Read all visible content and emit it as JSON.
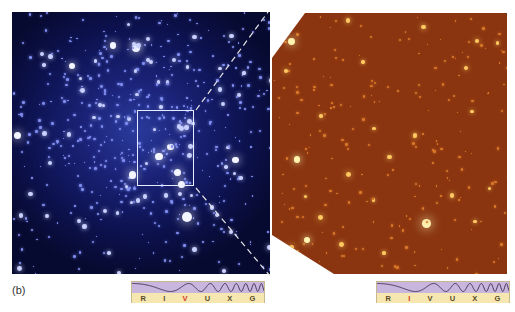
{
  "figure": {
    "panel_label": "(b)",
    "left_image": {
      "description": "star-cluster-visible-light",
      "color": "#1a2276",
      "zoom_box": {
        "left": 137,
        "top": 110,
        "width": 57,
        "height": 76
      }
    },
    "right_image": {
      "description": "star-cluster-infrared-zoom",
      "color": "#8a3510"
    },
    "spectrum_left": {
      "bands": [
        "R",
        "I",
        "V",
        "U",
        "X",
        "G"
      ],
      "highlighted": "V",
      "highlight_color": "#d4381c"
    },
    "spectrum_right": {
      "bands": [
        "R",
        "I",
        "V",
        "U",
        "X",
        "G"
      ],
      "highlighted": "I",
      "highlight_color": "#d4381c"
    }
  }
}
